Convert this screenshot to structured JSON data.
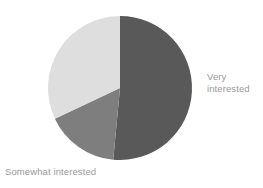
{
  "chart_data": {
    "type": "pie",
    "title": "",
    "subtitle": "",
    "xlabel": "",
    "ylabel": "",
    "legend_position": "none",
    "grid": false,
    "background_color": "#ffffff",
    "label_color": "#9a9a9a",
    "center": {
      "cx": 120,
      "cy": 88,
      "r": 72
    },
    "start_angle_deg": 0,
    "direction": "clockwise",
    "categories": [
      "Very interested",
      "Somewhat interested",
      "Not interested"
    ],
    "values": [
      51.5,
      16.5,
      32.0
    ],
    "labels_visible": [
      "Very\ninterested",
      "Somewhat interested"
    ],
    "slices": [
      {
        "name": "Very interested",
        "value": 51.5,
        "color": "#59595a",
        "start_angle_deg": 0,
        "end_angle_deg": 185.4,
        "label": "Very\ninterested",
        "label_shown": true
      },
      {
        "name": "Somewhat interested",
        "value": 16.5,
        "color": "#7e7e7e",
        "start_angle_deg": 185.4,
        "end_angle_deg": 244.8,
        "label": "Somewhat interested",
        "label_shown": true
      },
      {
        "name": "Not interested",
        "value": 32.0,
        "color": "#dedede",
        "start_angle_deg": 244.8,
        "end_angle_deg": 360,
        "label": "",
        "label_shown": false
      }
    ]
  },
  "labels": {
    "very_interested": "Very\ninterested",
    "somewhat_interested": "Somewhat interested"
  },
  "colors": {
    "slice_dark": "#59595a",
    "slice_mid": "#7e7e7e",
    "slice_light": "#dedede",
    "text": "#9a9a9a",
    "background": "#ffffff"
  }
}
